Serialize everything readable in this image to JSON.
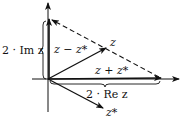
{
  "diagram": {
    "type": "complex-plane-vectors",
    "labels": {
      "z": "z",
      "z_conj": "z*",
      "sum": "z + z*",
      "diff": "z − z*",
      "two_im": "2 · Im z",
      "two_re": "2 · Re z"
    },
    "colors": {
      "ink": "#111111",
      "background": "#ffffff"
    }
  }
}
